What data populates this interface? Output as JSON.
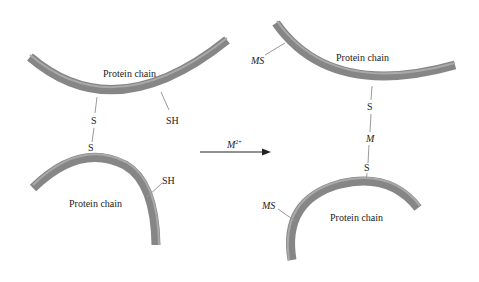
{
  "diagram": {
    "colors": {
      "chain_fill": "#8f8f8f",
      "chain_highlight": "#b5b5b5",
      "chain_shadow": "#6f6f6f",
      "line": "#9a9a9a",
      "text": "#222222"
    },
    "left": {
      "top_chain": {
        "label": "Protein chain",
        "groups": [
          "S",
          "SH"
        ]
      },
      "bottom_chain": {
        "label": "Protein chain",
        "groups": [
          "S",
          "SH"
        ]
      }
    },
    "arrow": {
      "reagent": "M",
      "charge": "2+"
    },
    "right": {
      "top_chain": {
        "label": "Protein chain",
        "groups": [
          "MS",
          "S"
        ]
      },
      "bridge_metal": "M",
      "bottom_chain": {
        "label": "Protein chain",
        "groups": [
          "S",
          "MS"
        ]
      }
    }
  }
}
